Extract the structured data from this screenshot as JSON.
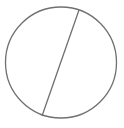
{
  "diagram": {
    "background": "#ffffff",
    "stroke_color": "#707070",
    "stroke_width": 1.3,
    "circle": {
      "cx": 61,
      "cy": 62.5,
      "r": 55.5
    },
    "chord": {
      "x1": 79,
      "y1": 10,
      "x2": 42,
      "y2": 116
    }
  }
}
